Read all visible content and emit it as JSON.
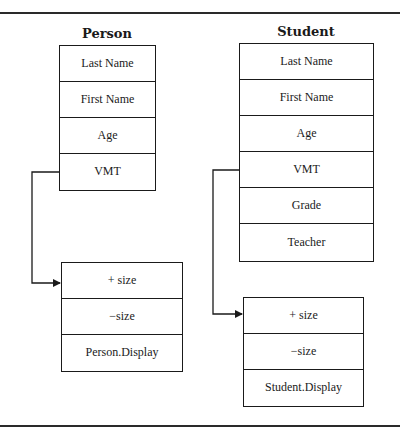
{
  "diagram": {
    "person": {
      "title": "Person",
      "fields": [
        "Last Name",
        "First Name",
        "Age",
        "VMT"
      ]
    },
    "person_vmt": {
      "entries": [
        "+ size",
        "−size",
        "Person.Display"
      ]
    },
    "student": {
      "title": "Student",
      "fields": [
        "Last Name",
        "First Name",
        "Age",
        "VMT",
        "Grade",
        "Teacher"
      ]
    },
    "student_vmt": {
      "entries": [
        "+ size",
        "−size",
        "Student.Display"
      ]
    },
    "colors": {
      "line": "#1a1a1a",
      "background": "#ffffff"
    }
  }
}
